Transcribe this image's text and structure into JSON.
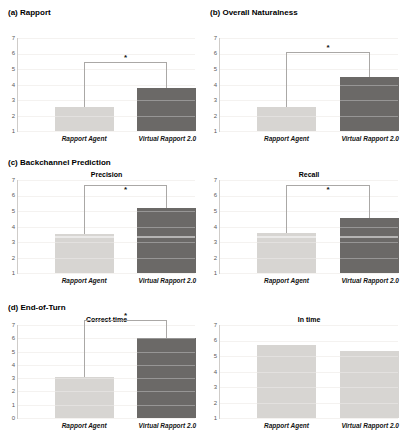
{
  "colors": {
    "bar_light": "#d7d5d2",
    "bar_dark": "#6b6967",
    "gridline": "#efedea",
    "axis": "#cfccc9",
    "bracket": "#aaa8a6",
    "tick_label": "#595959",
    "category_label": "#141414",
    "asterisk": "#111111"
  },
  "chart_data": [
    {
      "id": "rapport",
      "type": "bar",
      "section": "(a) Rapport",
      "title": null,
      "categories": [
        "Rapport Agent",
        "Virtual Rapport 2.0"
      ],
      "values": [
        2.55,
        3.8
      ],
      "bar_styles": [
        "light",
        "dark"
      ],
      "ylim": [
        1,
        7
      ],
      "yticks": [
        7,
        6,
        5,
        4,
        3,
        2,
        1
      ],
      "significance": {
        "label": "*",
        "y": 5.45,
        "star": "above"
      },
      "ref_line": null
    },
    {
      "id": "overall-naturalness",
      "type": "bar",
      "section": "(b) Overall Naturalness",
      "title": null,
      "categories": [
        "Rapport Agent",
        "Virtual Rapport 2.0"
      ],
      "values": [
        2.55,
        4.5
      ],
      "bar_styles": [
        "light",
        "dark"
      ],
      "ylim": [
        1,
        7
      ],
      "yticks": [
        7,
        6,
        5,
        4,
        3,
        2,
        1
      ],
      "significance": {
        "label": "*",
        "y": 6.1,
        "star": "above"
      },
      "ref_line": null
    },
    {
      "id": "backchannel-precision",
      "type": "bar",
      "section": "(c) Backchannel Prediction",
      "title": "Precision",
      "categories": [
        "Rapport Agent",
        "Virtual Rapport 2.0"
      ],
      "values": [
        3.5,
        5.2
      ],
      "bar_styles": [
        "light",
        "dark"
      ],
      "ylim": [
        1,
        7
      ],
      "yticks": [
        7,
        6,
        5,
        4,
        3,
        2,
        1
      ],
      "significance": {
        "label": "*",
        "y": 6.7,
        "star": "below"
      },
      "ref_line": 3.4
    },
    {
      "id": "backchannel-recall",
      "type": "bar",
      "section": null,
      "title": "Recall",
      "categories": [
        "Rapport Agent",
        "Virtual Rapport 2.0"
      ],
      "values": [
        3.6,
        4.55
      ],
      "bar_styles": [
        "light",
        "dark"
      ],
      "ylim": [
        1,
        7
      ],
      "yticks": [
        7,
        6,
        5,
        4,
        3,
        2,
        1
      ],
      "significance": {
        "label": "*",
        "y": 6.7,
        "star": "below"
      },
      "ref_line": 3.4
    },
    {
      "id": "endofturn-correct-time",
      "type": "bar",
      "section": "(d) End-of-Turn",
      "title": "Correct time",
      "categories": [
        "Rapport Agent",
        "Virtual Rapport 2.0"
      ],
      "values": [
        3.1,
        6.0
      ],
      "bar_styles": [
        "light",
        "dark"
      ],
      "ylim": [
        0,
        7
      ],
      "yticks": [
        7,
        6,
        5,
        4,
        3,
        2,
        1,
        0
      ],
      "significance": {
        "label": "*",
        "y": 7.4,
        "star": "above"
      },
      "ref_line": null
    },
    {
      "id": "endofturn-in-time",
      "type": "bar",
      "section": null,
      "title": "In time",
      "categories": [
        "Rapport Agent",
        "Virtual Rapport 2.0"
      ],
      "values": [
        5.7,
        5.35
      ],
      "bar_styles": [
        "light",
        "light"
      ],
      "ylim": [
        1,
        7
      ],
      "yticks": [
        7,
        6,
        5,
        4,
        3,
        2,
        1
      ],
      "significance": null,
      "ref_line": null
    }
  ]
}
